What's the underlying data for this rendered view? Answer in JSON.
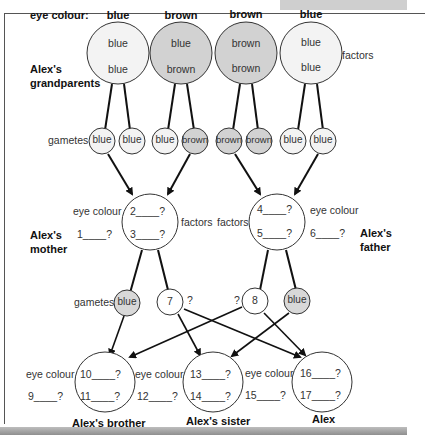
{
  "header": {
    "eye_colour_label": "eye colour:",
    "grandparent_eye_colours": [
      "blue",
      "brown",
      "brown",
      "blue"
    ]
  },
  "grandparents": {
    "label_line1": "Alex's",
    "label_line2": "grandparents",
    "factors_label": "factors",
    "circles": [
      {
        "top": "blue",
        "bottom": "blue",
        "fill": "#f3f3f3"
      },
      {
        "top": "blue",
        "bottom": "brown",
        "fill": "#d2d2d2"
      },
      {
        "top": "brown",
        "bottom": "brown",
        "fill": "#d2d2d2"
      },
      {
        "top": "blue",
        "bottom": "blue",
        "fill": "#f3f3f3"
      }
    ]
  },
  "gametes_row1": {
    "label": "gametes",
    "items": [
      "blue",
      "blue",
      "blue",
      "brown",
      "brown",
      "brown",
      "blue",
      "blue"
    ]
  },
  "mother": {
    "label_line1": "Alex's",
    "label_line2": "mother",
    "eye_colour_label": "eye colour",
    "eye_colour_blank": "1____?",
    "factor_top": "2____?",
    "factor_bottom": "3____?",
    "factors_label": "factors"
  },
  "father": {
    "label_line1": "Alex's",
    "label_line2": "father",
    "eye_colour_label": "eye colour",
    "eye_colour_blank": "6____?",
    "factor_top": "4____?",
    "factor_bottom": "5____?",
    "factors_label": "factors"
  },
  "gametes_row2": {
    "label": "gametes",
    "items": [
      {
        "text": "blue",
        "fill": "#d8d8d8",
        "suffix": ""
      },
      {
        "text": "7",
        "fill": "#ffffff",
        "suffix": "?"
      },
      {
        "text": "8",
        "fill": "#ffffff",
        "prefix": "?"
      },
      {
        "text": "blue",
        "fill": "#d8d8d8",
        "suffix": ""
      }
    ]
  },
  "children": [
    {
      "name": "Alex's brother",
      "eye_colour_label": "eye colour",
      "eye_colour_blank": "9____?",
      "factor_top": "10____?",
      "factor_bottom": "11____?"
    },
    {
      "name": "Alex's sister",
      "eye_colour_label": "eye colour",
      "eye_colour_blank": "12____?",
      "factor_top": "13____?",
      "factor_bottom": "14____?"
    },
    {
      "name": "Alex",
      "eye_colour_label": "eye colour",
      "eye_colour_blank": "15____?",
      "factor_top": "16____?",
      "factor_bottom": "17____?"
    }
  ],
  "colors": {
    "dominant_fill": "#d2d2d2",
    "recessive_fill": "#f3f3f3",
    "line": "#111111"
  }
}
